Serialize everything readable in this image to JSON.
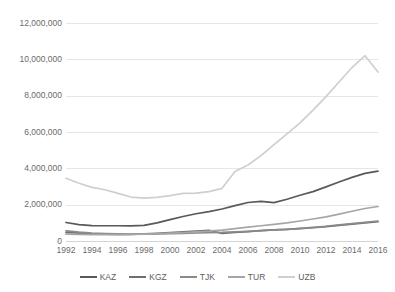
{
  "chart_data": {
    "type": "line",
    "title": "",
    "subtitle": "",
    "xlabel": "",
    "ylabel": "",
    "grid": true,
    "legend_position": "bottom",
    "x": [
      1992,
      1993,
      1994,
      1995,
      1996,
      1997,
      1998,
      1999,
      2000,
      2001,
      2002,
      2003,
      2004,
      2005,
      2006,
      2007,
      2008,
      2009,
      2010,
      2011,
      2012,
      2013,
      2014,
      2015,
      2016
    ],
    "xtick_labels": [
      "1992",
      "1994",
      "1996",
      "1998",
      "2000",
      "2002",
      "2004",
      "2006",
      "2008",
      "2010",
      "2012",
      "2014",
      "2016"
    ],
    "xticks": [
      1992,
      1994,
      1996,
      1998,
      2000,
      2002,
      2004,
      2006,
      2008,
      2010,
      2012,
      2014,
      2016
    ],
    "xlim": [
      1992,
      2016
    ],
    "ylim": [
      0,
      12000000
    ],
    "ytick_labels": [
      "12,000,000",
      "10,000,000",
      "8,000,000",
      "6,000,000",
      "4,000,000",
      "2,000,000",
      "0"
    ],
    "yticks": [
      12000000,
      10000000,
      8000000,
      6000000,
      4000000,
      2000000,
      0
    ],
    "series": [
      {
        "name": "KAZ",
        "color": "#595959",
        "values": [
          1020000,
          900000,
          850000,
          840000,
          840000,
          830000,
          860000,
          1000000,
          1180000,
          1350000,
          1500000,
          1620000,
          1760000,
          1950000,
          2120000,
          2180000,
          2110000,
          2300000,
          2520000,
          2720000,
          2980000,
          3250000,
          3500000,
          3720000,
          3850000
        ]
      },
      {
        "name": "KGZ",
        "color": "#6e6e6e",
        "values": [
          480000,
          430000,
          400000,
          380000,
          370000,
          370000,
          390000,
          420000,
          460000,
          500000,
          540000,
          590000,
          420000,
          470000,
          520000,
          570000,
          610000,
          640000,
          680000,
          730000,
          790000,
          860000,
          930000,
          1000000,
          1060000
        ]
      },
      {
        "name": "TJK",
        "color": "#8a8a8a",
        "values": [
          560000,
          490000,
          440000,
          410000,
          390000,
          380000,
          380000,
          390000,
          400000,
          420000,
          440000,
          460000,
          470000,
          500000,
          530000,
          570000,
          610000,
          640000,
          690000,
          750000,
          810000,
          890000,
          960000,
          1030000,
          1100000
        ]
      },
      {
        "name": "TUR",
        "color": "#a6a6a6",
        "values": [
          380000,
          360000,
          350000,
          350000,
          350000,
          360000,
          380000,
          400000,
          430000,
          460000,
          500000,
          540000,
          600000,
          680000,
          760000,
          840000,
          920000,
          1000000,
          1100000,
          1210000,
          1330000,
          1480000,
          1640000,
          1790000,
          1900000
        ]
      },
      {
        "name": "UZB",
        "color": "#cfcfcf",
        "values": [
          3450000,
          3180000,
          2950000,
          2820000,
          2620000,
          2420000,
          2360000,
          2400000,
          2500000,
          2620000,
          2640000,
          2720000,
          2900000,
          3820000,
          4180000,
          4700000,
          5300000,
          5900000,
          6500000,
          7200000,
          7950000,
          8750000,
          9550000,
          10200000,
          9300000
        ]
      }
    ],
    "legend": [
      {
        "label": "KAZ",
        "color": "#595959"
      },
      {
        "label": "KGZ",
        "color": "#6e6e6e"
      },
      {
        "label": "TJK",
        "color": "#8a8a8a"
      },
      {
        "label": "TUR",
        "color": "#a6a6a6"
      },
      {
        "label": "UZB",
        "color": "#cfcfcf"
      }
    ]
  }
}
